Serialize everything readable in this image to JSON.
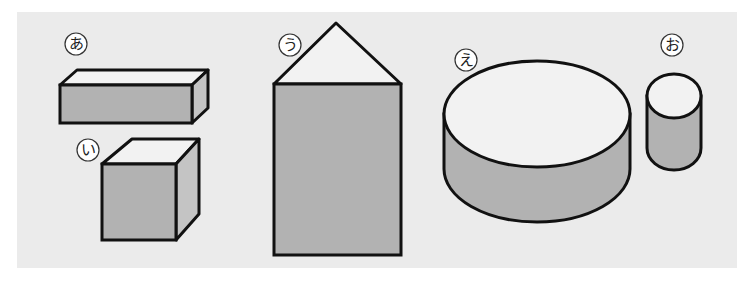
{
  "figure": {
    "background": "#ebebeb",
    "colors": {
      "light_face": "#f2f2f2",
      "dark_face": "#b2b2b2",
      "side_face": "#c4c4c4",
      "outline": "#111111"
    },
    "shapes": [
      {
        "id": "a",
        "label": "あ",
        "type": "rectangular-prism"
      },
      {
        "id": "i",
        "label": "い",
        "type": "cube"
      },
      {
        "id": "u",
        "label": "う",
        "type": "square-pyramid-on-prism"
      },
      {
        "id": "e",
        "label": "え",
        "type": "wide-cylinder"
      },
      {
        "id": "o",
        "label": "お",
        "type": "narrow-cylinder"
      }
    ]
  }
}
